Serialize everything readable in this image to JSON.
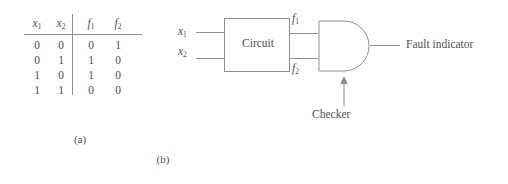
{
  "figure": {
    "background_color": "#ffffff",
    "stroke_color": "#8f8f8f",
    "text_color": "#4f4f4f"
  },
  "part_a": {
    "caption": "(a)",
    "table": {
      "headers": [
        "x",
        "x",
        "f",
        "f"
      ],
      "header_subscripts": [
        "1",
        "2",
        "1",
        "2"
      ],
      "rows": [
        [
          "0",
          "0",
          "0",
          "1"
        ],
        [
          "0",
          "1",
          "1",
          "0"
        ],
        [
          "1",
          "0",
          "1",
          "0"
        ],
        [
          "1",
          "1",
          "0",
          "0"
        ]
      ]
    }
  },
  "part_b": {
    "caption": "(b)",
    "inputs": [
      {
        "base": "x",
        "sub": "1"
      },
      {
        "base": "x",
        "sub": "2"
      }
    ],
    "block_label": "Circuit",
    "internal_signals": [
      {
        "base": "f",
        "sub": "1"
      },
      {
        "base": "f",
        "sub": "2"
      }
    ],
    "gate": {
      "type": "and-gate",
      "annotation": "Checker"
    },
    "output_label": "Fault indicator"
  }
}
